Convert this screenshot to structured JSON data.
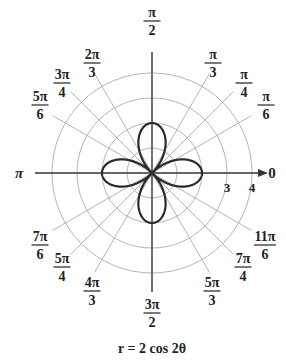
{
  "chart_data": {
    "type": "polar",
    "title": "r = 2 cos 2θ",
    "equation": "r = 2 cos 2θ",
    "function": "2*cos(2*theta)",
    "theta_range": [
      0,
      6.283185307
    ],
    "curve_shape": "four-leaved rose",
    "grid": true,
    "radial_circles": [
      1,
      2,
      3,
      4
    ],
    "radial_tick_labels": [
      {
        "r": 3,
        "label": "3"
      },
      {
        "r": 4,
        "label": "4"
      }
    ],
    "angle_labels": [
      {
        "angle_deg": 0,
        "num": "0",
        "den": ""
      },
      {
        "angle_deg": 30,
        "num": "π",
        "den": "6"
      },
      {
        "angle_deg": 45,
        "num": "π",
        "den": "4"
      },
      {
        "angle_deg": 60,
        "num": "π",
        "den": "3"
      },
      {
        "angle_deg": 90,
        "num": "π",
        "den": "2"
      },
      {
        "angle_deg": 120,
        "num": "2π",
        "den": "3"
      },
      {
        "angle_deg": 135,
        "num": "3π",
        "den": "4"
      },
      {
        "angle_deg": 150,
        "num": "5π",
        "den": "6"
      },
      {
        "angle_deg": 180,
        "num": "π",
        "den": ""
      },
      {
        "angle_deg": 210,
        "num": "7π",
        "den": "6"
      },
      {
        "angle_deg": 225,
        "num": "5π",
        "den": "4"
      },
      {
        "angle_deg": 240,
        "num": "4π",
        "den": "3"
      },
      {
        "angle_deg": 270,
        "num": "3π",
        "den": "2"
      },
      {
        "angle_deg": 300,
        "num": "5π",
        "den": "3"
      },
      {
        "angle_deg": 315,
        "num": "7π",
        "den": "4"
      },
      {
        "angle_deg": 330,
        "num": "11π",
        "den": "6"
      }
    ],
    "lobe_tips": [
      {
        "angle_deg": 0,
        "r": 2
      },
      {
        "angle_deg": 90,
        "r": 2
      },
      {
        "angle_deg": 180,
        "r": 2
      },
      {
        "angle_deg": 270,
        "r": 2
      }
    ],
    "colors": {
      "curve": "#2a2a2a",
      "grid": "#b5b5b5",
      "axis": "#333333",
      "text": "#222222"
    }
  },
  "caption": "r = 2 cos 2θ"
}
